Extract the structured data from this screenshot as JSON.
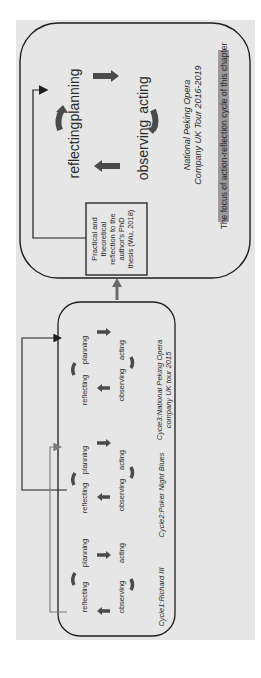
{
  "diagram": {
    "orientation": "rotated 90° counter-clockwise",
    "main_cycle": {
      "labels": [
        "planning",
        "acting",
        "observing",
        "reflecting"
      ],
      "caption_line1": "National Peking Opera",
      "caption_line2": "Company UK Tour 2016-2019",
      "focus_label": "The focus of action-reflection cycle of this chapter"
    },
    "reflection_box": {
      "lines": [
        "Practical and",
        "theoretical",
        "reflection to the",
        "author's PhD",
        "thesis (Wu, 2018)"
      ]
    },
    "cycles": [
      {
        "labels": [
          "planning",
          "acting",
          "observing",
          "reflecting"
        ],
        "caption_line1": "Cycle1:Richard III",
        "caption_line2": ""
      },
      {
        "labels": [
          "planning",
          "acting",
          "observing",
          "reflecting"
        ],
        "caption_line1": "Cycle2:Poker Night Blues",
        "caption_line2": ""
      },
      {
        "labels": [
          "planning",
          "acting",
          "observing",
          "reflecting"
        ],
        "caption_line1": "Cycle3:National Peking Opera",
        "caption_line2": "company UK tour 2015"
      }
    ],
    "colors": {
      "background": "#e6e6e6",
      "arrow": "#4a4a4a",
      "outline": "#1e1e1e",
      "focus_highlight": "#9a9a9a",
      "connector_light": "#7a7a7a"
    }
  }
}
